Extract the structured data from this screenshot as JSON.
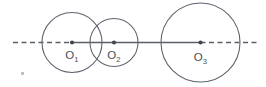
{
  "figure": {
    "type": "geometry-diagram",
    "canvas": {
      "width": 266,
      "height": 87,
      "background": "#ffffff"
    },
    "colors": {
      "stroke": "#5f6670",
      "axis": "#5a6068",
      "dot": "#42464c",
      "label": "#4a4f56",
      "stray_mark": "#bdbfc2"
    },
    "axis": {
      "name": "line-of-centers",
      "y": 42.5,
      "dashed_left": {
        "x1": 13,
        "x2": 72
      },
      "solid_middle": {
        "x1": 72,
        "x2": 200.5
      },
      "dashed_right": {
        "x1": 200.5,
        "x2": 257
      },
      "dash_pattern": "5 3.5"
    },
    "circles": [
      {
        "id": "circle-1",
        "label": "O",
        "subscript": "1",
        "center_x": 72,
        "center_y": 42.5,
        "radius": 30,
        "label_x": 72,
        "label_y": 59
      },
      {
        "id": "circle-2",
        "label": "O",
        "subscript": "2",
        "center_x": 114,
        "center_y": 42.5,
        "radius": 24,
        "label_x": 114,
        "label_y": 59
      },
      {
        "id": "circle-3",
        "label": "O",
        "subscript": "3",
        "center_x": 200.5,
        "center_y": 42.5,
        "radius": 39.5,
        "label_x": 200.5,
        "label_y": 61
      }
    ],
    "center_dot_radius": 2.1,
    "stray_mark": {
      "x": 21,
      "y": 72,
      "width": 3,
      "height": 3
    }
  }
}
